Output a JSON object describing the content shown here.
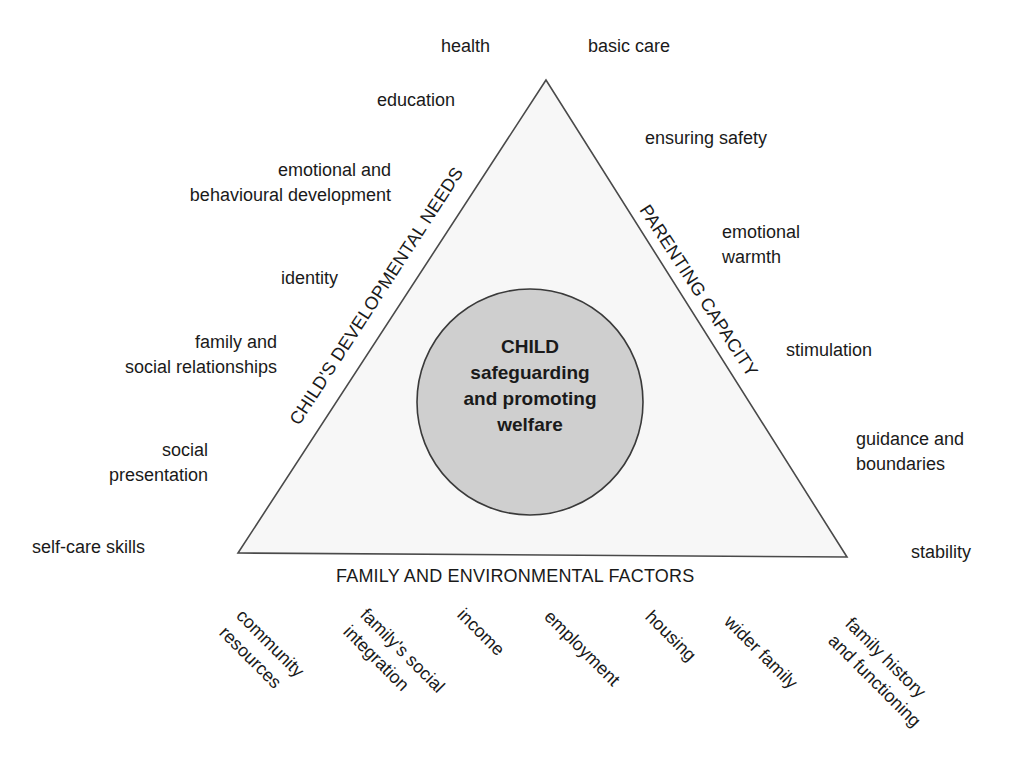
{
  "center": {
    "title": "CHILD",
    "line2": "safeguarding",
    "line3": "and promoting",
    "line4": "welfare"
  },
  "sides": {
    "left": "CHILD'S DEVELOPMENTAL NEEDS",
    "right": "PARENTING CAPACITY",
    "bottom": "FAMILY AND ENVIRONMENTAL FACTORS"
  },
  "developmental_needs": [
    {
      "lines": [
        "health"
      ]
    },
    {
      "lines": [
        "education"
      ]
    },
    {
      "lines": [
        "emotional and",
        "behavioural development"
      ]
    },
    {
      "lines": [
        "identity"
      ]
    },
    {
      "lines": [
        "family and",
        "social relationships"
      ]
    },
    {
      "lines": [
        "social",
        "presentation"
      ]
    },
    {
      "lines": [
        "self-care skills"
      ]
    }
  ],
  "parenting_capacity": [
    {
      "lines": [
        "basic care"
      ]
    },
    {
      "lines": [
        "ensuring safety"
      ]
    },
    {
      "lines": [
        "emotional",
        "warmth"
      ]
    },
    {
      "lines": [
        "stimulation"
      ]
    },
    {
      "lines": [
        "guidance and",
        "boundaries"
      ]
    },
    {
      "lines": [
        "stability"
      ]
    }
  ],
  "family_environmental": [
    {
      "lines": [
        "community",
        "resources"
      ]
    },
    {
      "lines": [
        "family's social",
        "integration"
      ]
    },
    {
      "lines": [
        "income"
      ]
    },
    {
      "lines": [
        "employment"
      ]
    },
    {
      "lines": [
        "housing"
      ]
    },
    {
      "lines": [
        "wider family"
      ]
    },
    {
      "lines": [
        "family history",
        "and functioning"
      ]
    }
  ],
  "colors": {
    "triangle_fill": "#f7f7f7",
    "triangle_stroke": "#4a4a4a",
    "circle_fill": "#cfcfcf",
    "circle_stroke": "#3a3a3a",
    "text": "#1a1a1a"
  }
}
